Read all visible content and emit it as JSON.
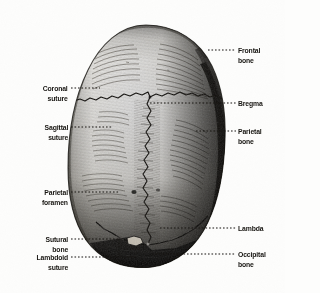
{
  "figure": {
    "view": "superior",
    "background_color": "#fdfdfc",
    "ink_color": "#15130f"
  },
  "labels_right": [
    {
      "id": "frontal-bone",
      "text": "Frontal",
      "text2": "bone",
      "x": 238,
      "y": 46,
      "leader_from": 208,
      "leader_to": 236,
      "leader_y": 50
    },
    {
      "id": "bregma",
      "text": "Bregma",
      "text2": "",
      "x": 238,
      "y": 99,
      "leader_from": 150,
      "leader_to": 236,
      "leader_y": 103
    },
    {
      "id": "parietal-bone",
      "text": "Parietal",
      "text2": "bone",
      "x": 238,
      "y": 127,
      "leader_from": 196,
      "leader_to": 236,
      "leader_y": 131
    },
    {
      "id": "lambda",
      "text": "Lambda",
      "text2": "",
      "x": 238,
      "y": 224,
      "leader_from": 160,
      "leader_to": 236,
      "leader_y": 228
    },
    {
      "id": "occipital-bone",
      "text": "Occipital",
      "text2": "bone",
      "x": 238,
      "y": 250,
      "leader_from": 152,
      "leader_to": 236,
      "leader_y": 254
    }
  ],
  "labels_left": [
    {
      "id": "coronal-suture",
      "text": "Coronal",
      "text2": "suture",
      "x": 68,
      "y": 84,
      "leader_from": 71,
      "leader_to": 100,
      "leader_y": 88
    },
    {
      "id": "sagittal-suture",
      "text": "Sagittal",
      "text2": "suture",
      "x": 68,
      "y": 123,
      "leader_from": 71,
      "leader_to": 113,
      "leader_y": 127
    },
    {
      "id": "parietal-foramen",
      "text": "Parietal",
      "text2": "foramen",
      "x": 68,
      "y": 188,
      "leader_from": 71,
      "leader_to": 120,
      "leader_y": 192
    },
    {
      "id": "sutural-bone",
      "text": "Sutural",
      "text2": "bone",
      "x": 68,
      "y": 235,
      "leader_from": 71,
      "leader_to": 119,
      "leader_y": 239
    },
    {
      "id": "lambdoid-suture",
      "text": "Lambdoid",
      "text2": "suture",
      "x": 68,
      "y": 253,
      "leader_from": 71,
      "leader_to": 137,
      "leader_y": 257
    }
  ],
  "connector": {
    "id": "sutural-bone-elbow",
    "x": 119,
    "y_top": 239,
    "y_bottom": 257
  },
  "anatomy": {
    "skull_bounds": {
      "left": 68,
      "top": 25,
      "right": 225,
      "bottom": 267
    },
    "parts": [
      "frontal bone",
      "parietal bone",
      "occipital bone",
      "coronal suture",
      "sagittal suture",
      "lambdoid suture",
      "parietal foramen",
      "sutural bone",
      "bregma",
      "lambda"
    ]
  }
}
